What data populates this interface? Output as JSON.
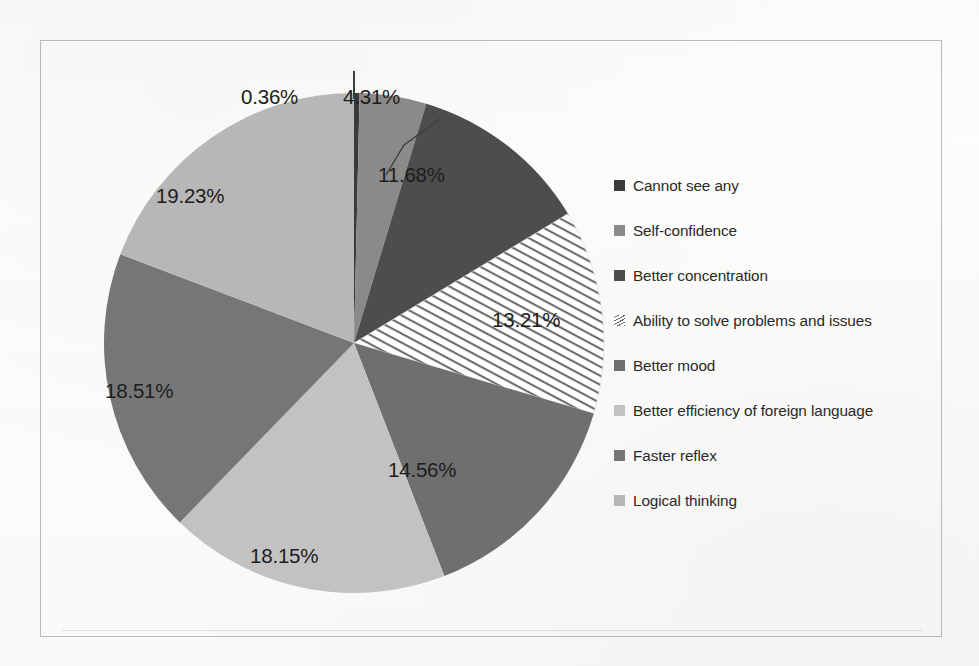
{
  "chart_data": {
    "type": "pie",
    "title": "",
    "subtitle": "",
    "xlabel": "",
    "ylabel": "",
    "legend_position": "right",
    "grid": false,
    "start_angle_deg": 0,
    "direction": "clockwise",
    "units": "percent",
    "total": 100.01,
    "categories": [
      "Cannot see any",
      "Self-confidence",
      "Better concentration",
      "Ability to solve problems and issues",
      "Better mood",
      "Better efficiency of foreign language",
      "Faster reflex",
      "Logical thinking"
    ],
    "values": [
      0.36,
      4.31,
      11.68,
      13.21,
      14.56,
      18.15,
      18.51,
      19.23
    ],
    "data_labels": [
      "0.36%",
      "4.31%",
      "11.68%",
      "13.21%",
      "14.56%",
      "18.15%",
      "18.51%",
      "19.23%"
    ],
    "slice_colors": [
      "#3a3a3a",
      "#8a8a8a",
      "#4d4d4d",
      "hatch",
      "#6f6f6f",
      "#c2c2c2",
      "#767676",
      "#b7b7b7"
    ],
    "slices": [
      {
        "label": "Cannot see any",
        "value": 0.36,
        "display": "0.36%",
        "color": "#3a3a3a",
        "pattern": "solid",
        "label_placement": "outside-leader"
      },
      {
        "label": "Self-confidence",
        "value": 4.31,
        "display": "4.31%",
        "color": "#8a8a8a",
        "pattern": "solid",
        "label_placement": "outside-leader"
      },
      {
        "label": "Better concentration",
        "value": 11.68,
        "display": "11.68%",
        "color": "#4d4d4d",
        "pattern": "solid",
        "label_placement": "inside"
      },
      {
        "label": "Ability to solve problems and issues",
        "value": 13.21,
        "display": "13.21%",
        "color": "#ffffff",
        "pattern": "diagonal-stripes",
        "label_placement": "inside"
      },
      {
        "label": "Better mood",
        "value": 14.56,
        "display": "14.56%",
        "color": "#6f6f6f",
        "pattern": "solid",
        "label_placement": "inside"
      },
      {
        "label": "Better efficiency of foreign language",
        "value": 18.15,
        "display": "18.15%",
        "color": "#c2c2c2",
        "pattern": "solid",
        "label_placement": "inside"
      },
      {
        "label": "Faster reflex",
        "value": 18.51,
        "display": "18.51%",
        "color": "#767676",
        "pattern": "solid",
        "label_placement": "inside"
      },
      {
        "label": "Logical thinking",
        "value": 19.23,
        "display": "19.23%",
        "color": "#b7b7b7",
        "pattern": "solid",
        "label_placement": "inside"
      }
    ]
  },
  "labels": {
    "v1": "0.36%",
    "v2": "4.31%",
    "v3": "11.68%",
    "v4": "13.21%",
    "v5": "14.56%",
    "v6": "18.15%",
    "v7": "18.51%",
    "v8": "19.23%"
  },
  "legend": {
    "items": [
      {
        "label": "Cannot see any",
        "color": "#3a3a3a",
        "pattern": "solid"
      },
      {
        "label": "Self-confidence",
        "color": "#8a8a8a",
        "pattern": "solid"
      },
      {
        "label": "Better concentration",
        "color": "#4d4d4d",
        "pattern": "solid"
      },
      {
        "label": "Ability to solve problems and issues",
        "color": "#ffffff",
        "pattern": "diagonal-stripes"
      },
      {
        "label": "Better mood",
        "color": "#6f6f6f",
        "pattern": "solid"
      },
      {
        "label": "Better efficiency of foreign language",
        "color": "#c2c2c2",
        "pattern": "solid"
      },
      {
        "label": "Faster reflex",
        "color": "#767676",
        "pattern": "solid"
      },
      {
        "label": "Logical thinking",
        "color": "#b7b7b7",
        "pattern": "solid"
      }
    ]
  },
  "page": {
    "frame_color": "#b9b9b9",
    "background_color": "#fdfdfc",
    "text_color": "#1d1d1d"
  }
}
